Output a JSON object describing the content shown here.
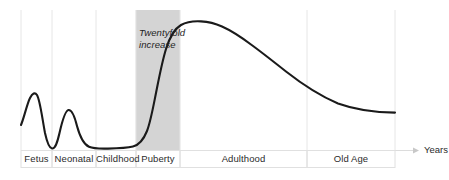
{
  "chart_data": {
    "type": "line",
    "title": "",
    "subtitle": "",
    "xlabel": "Years",
    "ylabel": "",
    "grid": true,
    "legend": false,
    "legend_position": "none",
    "xlim": [
      0,
      100
    ],
    "ylim": [
      0,
      100
    ],
    "axis_arrow": true,
    "categories": [
      "Fetus",
      "Neonatal",
      "Childhood",
      "Puberty",
      "Adulthood",
      "Old Age"
    ],
    "bands": [
      {
        "label": "Fetus",
        "x_start": 0,
        "x_end": 8.3,
        "shaded": false
      },
      {
        "label": "Neonatal",
        "x_start": 8.3,
        "x_end": 20.1,
        "shaded": false
      },
      {
        "label": "Childhood",
        "x_start": 20.1,
        "x_end": 30.7,
        "shaded": false
      },
      {
        "label": "Puberty",
        "x_start": 30.7,
        "x_end": 42.5,
        "shaded": true
      },
      {
        "label": "Adulthood",
        "x_start": 42.5,
        "x_end": 76.5,
        "shaded": false
      },
      {
        "label": "Old Age",
        "x_start": 76.5,
        "x_end": 100,
        "shaded": false
      }
    ],
    "shaded_region": {
      "label": "Puberty",
      "color": "#d4d4d4",
      "x_start": 30.7,
      "x_end": 42.5
    },
    "annotations": [
      {
        "text_line_1": "Twentyfold",
        "text_line_2": "increase",
        "x": 32,
        "y": 78,
        "style": "italic"
      }
    ],
    "series": [
      {
        "name": "Hormone level",
        "color": "#1a1a1a",
        "x": [
          0,
          2.1,
          4.0,
          5.6,
          7.2,
          8.3,
          9.6,
          11.0,
          12.6,
          14.2,
          16.0,
          18.5,
          21.0,
          24.0,
          27.0,
          30.7,
          33.0,
          35.5,
          38.0,
          40.5,
          42.5,
          45.0,
          48.0,
          52.0,
          58.0,
          64.0,
          70.0,
          76.5,
          83.0,
          90.0,
          96.0,
          100
        ],
        "y": [
          19.3,
          32.0,
          41.5,
          29.0,
          5.0,
          1.5,
          8.0,
          20.0,
          28.5,
          22.0,
          12.0,
          5.5,
          2.5,
          1.5,
          1.3,
          2.8,
          10.0,
          26.0,
          48.0,
          68.0,
          80.0,
          88.0,
          91.5,
          92.0,
          90.0,
          86.0,
          79.5,
          71.0,
          61.0,
          50.0,
          42.0,
          37.0
        ]
      }
    ],
    "features": [
      {
        "name": "fetal-peak",
        "x": 4.0,
        "y": 41.5
      },
      {
        "name": "neonatal-trough",
        "x": 8.3,
        "y": 1.5
      },
      {
        "name": "neonatal-peak",
        "x": 12.6,
        "y": 28.5
      },
      {
        "name": "childhood-plateau",
        "x": 25.0,
        "y": 1.4
      },
      {
        "name": "adult-peak",
        "x": 50.0,
        "y": 92.0
      },
      {
        "name": "old-age-end",
        "x": 100,
        "y": 37.0
      }
    ]
  },
  "axis": {
    "years_label": "Years"
  },
  "annotation": {
    "line1": "Twentyfold",
    "line2": "increase"
  },
  "stages": {
    "fetus": "Fetus",
    "neonatal": "Neonatal",
    "childhood": "Childhood",
    "puberty": "Puberty",
    "adulthood": "Adulthood",
    "old_age": "Old Age"
  },
  "colors": {
    "curve": "#1a1a1a",
    "shaded_band": "#d4d4d4",
    "gridline": "#e6e6e6",
    "label_border": "#e0e0e0",
    "text": "#2b2b2b",
    "background": "#ffffff"
  }
}
